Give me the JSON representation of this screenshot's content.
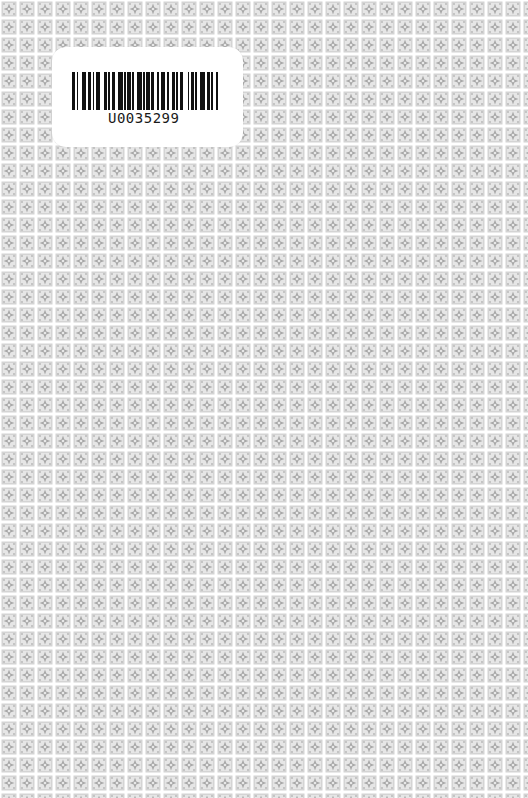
{
  "cover": {
    "background_color": "#f2f2f2",
    "pattern": {
      "tile_size_px": 18,
      "tile_color": "#c8c8c8",
      "motif_color": "#a9a9a9",
      "gutter_color": "#ffffff"
    }
  },
  "barcode_label": {
    "code": "U0035299",
    "label_color": "#ffffff",
    "bar_color": "#111111",
    "bars": [
      2,
      1,
      1,
      2,
      3,
      1,
      2,
      1,
      1,
      1,
      3,
      2,
      2,
      1,
      1,
      1,
      2,
      2,
      3,
      1,
      1,
      1,
      2,
      1,
      1,
      2,
      3,
      1,
      1,
      1,
      2,
      1,
      2,
      2,
      1,
      1,
      3,
      1,
      1,
      2,
      2,
      1,
      1,
      1,
      2,
      3,
      1,
      1,
      2,
      1,
      1,
      2,
      3,
      1,
      2,
      1,
      1,
      2,
      1
    ]
  }
}
